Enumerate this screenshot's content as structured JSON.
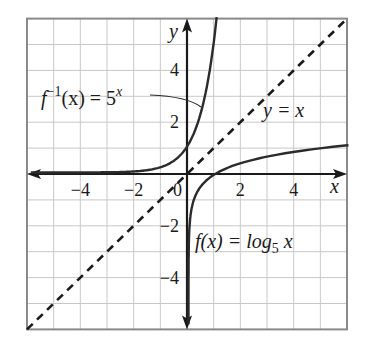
{
  "chart_data": {
    "type": "line",
    "title": "",
    "xlabel": "x",
    "ylabel": "y",
    "xlim": [
      -6,
      6
    ],
    "ylim": [
      -6,
      6
    ],
    "grid": true,
    "grid_step": 1,
    "x_ticks": [
      {
        "value": -4,
        "label": "−4"
      },
      {
        "value": -2,
        "label": "−2"
      },
      {
        "value": 0,
        "label": "0"
      },
      {
        "value": 2,
        "label": "2"
      },
      {
        "value": 4,
        "label": "4"
      }
    ],
    "y_ticks": [
      {
        "value": 4,
        "label": "4"
      },
      {
        "value": 2,
        "label": "2"
      },
      {
        "value": -2,
        "label": "−2"
      },
      {
        "value": -4,
        "label": "−4"
      }
    ],
    "series": [
      {
        "name": "f^{-1}(x) = 5^x",
        "function": "5^x",
        "style": "solid",
        "color": "#2b2b2b",
        "points": [
          [
            -6,
            0.0001
          ],
          [
            -2,
            0.04
          ],
          [
            -1,
            0.2
          ],
          [
            0,
            1
          ],
          [
            0.5,
            2.24
          ],
          [
            1,
            5
          ],
          [
            1.11,
            6
          ]
        ]
      },
      {
        "name": "f(x) = log_5 x",
        "function": "log5(x)",
        "style": "solid",
        "color": "#2b2b2b",
        "points": [
          [
            0.0001,
            -6
          ],
          [
            0.04,
            -2
          ],
          [
            0.2,
            -1
          ],
          [
            1,
            0
          ],
          [
            2.24,
            0.5
          ],
          [
            5,
            1
          ],
          [
            6,
            1.11
          ]
        ]
      },
      {
        "name": "y = x",
        "function": "x",
        "style": "dashed",
        "color": "#1a1a1a",
        "points": [
          [
            -6,
            -6
          ],
          [
            6,
            6
          ]
        ]
      }
    ],
    "annotations": [
      {
        "text_main": "f",
        "sup": "−1",
        "text_rest": "(x) = 5",
        "sup2": "x",
        "x": -5.7,
        "y": 2.9
      },
      {
        "text_main": "y = x",
        "x": 2.8,
        "y": 2.2
      },
      {
        "text_main": "f(x) = log",
        "sub": "5",
        "text_rest": " x",
        "x": 0.25,
        "y": -2.6
      }
    ]
  },
  "labels": {
    "x_axis": "x",
    "y_axis": "y",
    "inverse_fn": {
      "f": "f",
      "sup": "−1",
      "mid": "(x) = 5",
      "exp": "x"
    },
    "identity": "y = x",
    "log_fn": {
      "pre": "f(x) = log",
      "base": "5",
      "post": " x"
    }
  },
  "colors": {
    "grid": "#c8c8c8",
    "border": "#8a8a8a",
    "axis": "#1a1a1a",
    "curve": "#2b2b2b"
  }
}
